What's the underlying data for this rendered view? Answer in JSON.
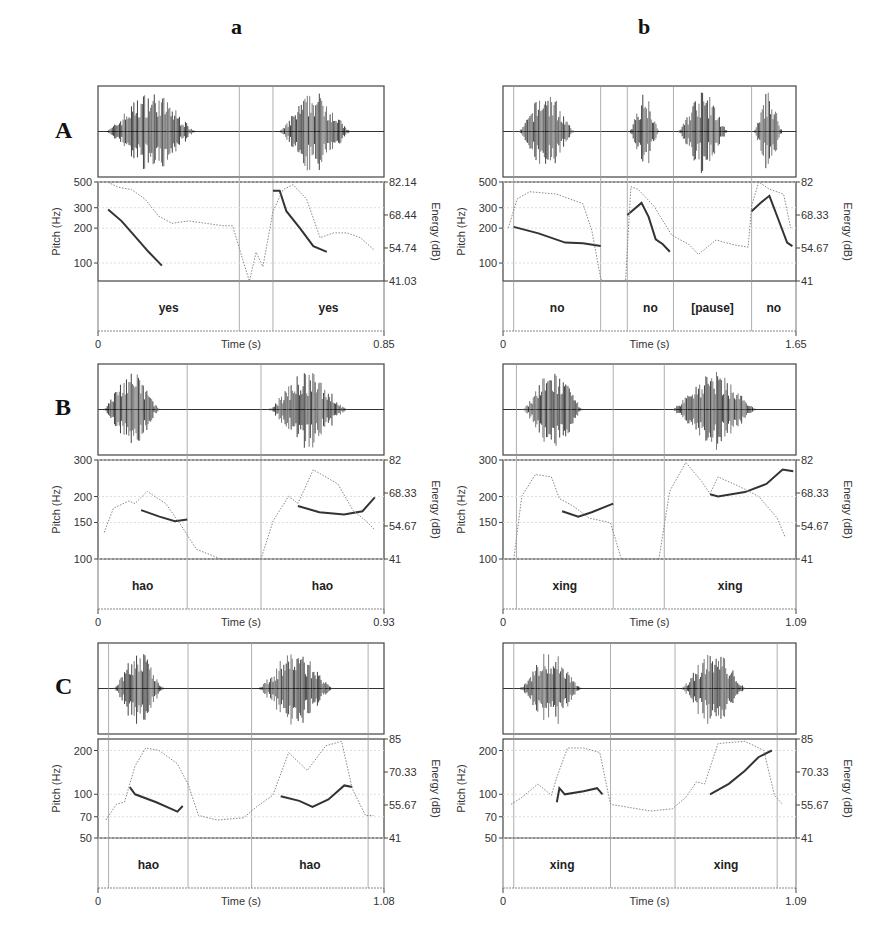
{
  "columns": [
    {
      "label": "a"
    },
    {
      "label": "b"
    }
  ],
  "rows": [
    {
      "label": "A"
    },
    {
      "label": "B"
    },
    {
      "label": "C"
    }
  ],
  "axis_labels": {
    "pitch": "Pitch (Hz)",
    "energy": "Energy (dB)",
    "time": "Time (s)"
  },
  "chart_data": [
    {
      "id": "A-a",
      "type": "line",
      "row": "A",
      "column": "a",
      "title": "",
      "xlabel": "Time (s)",
      "ylabel": "Pitch (Hz)",
      "ylabel_right": "Energy (dB)",
      "xlim": [
        0,
        0.85
      ],
      "x_ticks": [
        "0",
        "0.85"
      ],
      "pitch_ticks": [
        "500",
        "300",
        "200",
        "100"
      ],
      "pitch_ylim": [
        70,
        500
      ],
      "pitch_scale": "log",
      "energy_ticks": [
        "82.14",
        "68.44",
        "54.74",
        "41.03"
      ],
      "energy_ylim": [
        41.03,
        82.14
      ],
      "words": [
        {
          "text": "yes",
          "start": 0.0,
          "end": 0.42
        },
        {
          "text": "yes",
          "start": 0.52,
          "end": 0.85
        }
      ],
      "boundaries": [
        0.42,
        0.52
      ],
      "series": [
        {
          "name": "Pitch (solid)",
          "x": [
            0.03,
            0.07,
            0.11,
            0.15,
            0.19
          ],
          "values": [
            290,
            230,
            170,
            125,
            95
          ]
        },
        {
          "name": "Pitch (solid) 2",
          "x": [
            0.52,
            0.54,
            0.56,
            0.6,
            0.64,
            0.68
          ],
          "values": [
            420,
            420,
            280,
            200,
            140,
            125
          ]
        },
        {
          "name": "Energy (dotted)",
          "x": [
            0.03,
            0.06,
            0.1,
            0.14,
            0.18,
            0.22,
            0.27,
            0.32,
            0.37,
            0.4,
            0.43,
            0.45,
            0.47,
            0.49,
            0.52,
            0.55,
            0.58,
            0.62,
            0.66,
            0.7,
            0.74,
            0.78,
            0.82
          ],
          "values": [
            82,
            80,
            79,
            75,
            68,
            65,
            66,
            65,
            64,
            64,
            50,
            41,
            53,
            47,
            70,
            79,
            81,
            75,
            59,
            61,
            61,
            59,
            54
          ]
        }
      ]
    },
    {
      "id": "A-b",
      "type": "line",
      "row": "A",
      "column": "b",
      "title": "",
      "xlabel": "Time (s)",
      "ylabel": "Pitch (Hz)",
      "ylabel_right": "Energy (dB)",
      "xlim": [
        0,
        1.65
      ],
      "x_ticks": [
        "0",
        "1.65"
      ],
      "pitch_ticks": [
        "500",
        "300",
        "200",
        "100"
      ],
      "pitch_ylim": [
        70,
        500
      ],
      "pitch_scale": "log",
      "energy_ticks": [
        "82",
        "68.33",
        "54.67",
        "41"
      ],
      "energy_ylim": [
        41,
        82
      ],
      "words": [
        {
          "text": "no",
          "start": 0.06,
          "end": 0.55
        },
        {
          "text": "no",
          "start": 0.7,
          "end": 0.96
        },
        {
          "text": "[pause]",
          "start": 0.96,
          "end": 1.4
        },
        {
          "text": "no",
          "start": 1.4,
          "end": 1.65
        }
      ],
      "boundaries": [
        0.06,
        0.55,
        0.7,
        0.96,
        1.4
      ],
      "series": [
        {
          "name": "Pitch (solid)",
          "x": [
            0.06,
            0.2,
            0.35,
            0.45,
            0.55
          ],
          "values": [
            205,
            180,
            150,
            148,
            140
          ]
        },
        {
          "name": "Pitch (solid) 2",
          "x": [
            0.7,
            0.78,
            0.82,
            0.86,
            0.9,
            0.94
          ],
          "values": [
            260,
            330,
            250,
            160,
            145,
            125
          ]
        },
        {
          "name": "Pitch (solid) 3",
          "x": [
            1.4,
            1.45,
            1.5,
            1.55,
            1.6,
            1.63
          ],
          "values": [
            280,
            330,
            380,
            240,
            150,
            140
          ]
        },
        {
          "name": "Energy (dotted)",
          "x": [
            0.03,
            0.08,
            0.15,
            0.3,
            0.45,
            0.5,
            0.55,
            0.56,
            0.69,
            0.72,
            0.76,
            0.85,
            0.95,
            1.05,
            1.1,
            1.2,
            1.3,
            1.38,
            1.4,
            1.44,
            1.5,
            1.58,
            1.62
          ],
          "values": [
            63,
            75,
            78,
            77,
            73,
            62,
            42,
            41,
            41,
            80,
            79,
            72,
            60,
            56,
            52,
            58,
            56,
            55,
            72,
            82,
            79,
            77,
            63
          ]
        }
      ]
    },
    {
      "id": "B-a",
      "type": "line",
      "row": "B",
      "column": "a",
      "title": "",
      "xlabel": "Time (s)",
      "ylabel": "Pitch (Hz)",
      "ylabel_right": "Energy (dB)",
      "xlim": [
        0,
        0.93
      ],
      "x_ticks": [
        "0",
        "0.93"
      ],
      "pitch_ticks": [
        "300",
        "200",
        "150",
        "100"
      ],
      "pitch_ylim": [
        100,
        300
      ],
      "pitch_scale": "log",
      "energy_ticks": [
        "82",
        "68.33",
        "54.67",
        "41"
      ],
      "energy_ylim": [
        41,
        82
      ],
      "words": [
        {
          "text": "hao",
          "start": 0.0,
          "end": 0.29
        },
        {
          "text": "hao",
          "start": 0.53,
          "end": 0.93
        }
      ],
      "boundaries": [
        0.29,
        0.53
      ],
      "series": [
        {
          "name": "Pitch (solid)",
          "x": [
            0.14,
            0.2,
            0.25,
            0.29
          ],
          "values": [
            172,
            160,
            152,
            155
          ]
        },
        {
          "name": "Pitch (solid) 2",
          "x": [
            0.65,
            0.72,
            0.8,
            0.86,
            0.9
          ],
          "values": [
            180,
            168,
            164,
            170,
            198
          ]
        },
        {
          "name": "Energy (dotted)",
          "x": [
            0.02,
            0.05,
            0.1,
            0.12,
            0.16,
            0.22,
            0.27,
            0.32,
            0.4,
            0.53,
            0.57,
            0.62,
            0.65,
            0.7,
            0.78,
            0.83,
            0.87,
            0.9
          ],
          "values": [
            52,
            62,
            65,
            64,
            69,
            64,
            55,
            45,
            41,
            41,
            57,
            67,
            64,
            78,
            72,
            61,
            57,
            53
          ]
        }
      ]
    },
    {
      "id": "B-b",
      "type": "line",
      "row": "B",
      "column": "b",
      "title": "",
      "xlabel": "Time (s)",
      "ylabel": "Pitch (Hz)",
      "ylabel_right": "Energy (dB)",
      "xlim": [
        0,
        1.09
      ],
      "x_ticks": [
        "0",
        "1.09"
      ],
      "pitch_ticks": [
        "300",
        "200",
        "150",
        "100"
      ],
      "pitch_ylim": [
        100,
        300
      ],
      "pitch_scale": "log",
      "energy_ticks": [
        "82",
        "68.33",
        "54.67",
        "41"
      ],
      "energy_ylim": [
        41,
        82
      ],
      "words": [
        {
          "text": "xing",
          "start": 0.05,
          "end": 0.41
        },
        {
          "text": "xing",
          "start": 0.6,
          "end": 1.09
        }
      ],
      "boundaries": [
        0.05,
        0.41,
        0.6
      ],
      "series": [
        {
          "name": "Pitch (solid)",
          "x": [
            0.22,
            0.28,
            0.33,
            0.41
          ],
          "values": [
            170,
            160,
            168,
            185
          ]
        },
        {
          "name": "Pitch (solid) 2",
          "x": [
            0.77,
            0.8,
            0.9,
            0.98,
            1.04,
            1.08
          ],
          "values": [
            205,
            200,
            210,
            230,
            270,
            265
          ]
        },
        {
          "name": "Energy (dotted)",
          "x": [
            0.04,
            0.07,
            0.12,
            0.18,
            0.21,
            0.26,
            0.32,
            0.4,
            0.44,
            0.58,
            0.62,
            0.68,
            0.74,
            0.77,
            0.8,
            0.88,
            0.95,
            1.02,
            1.05
          ],
          "values": [
            41,
            67,
            76,
            75,
            66,
            63,
            58,
            56,
            41,
            41,
            69,
            81,
            73,
            68,
            75,
            71,
            67,
            58,
            50
          ]
        }
      ]
    },
    {
      "id": "C-a",
      "type": "line",
      "row": "C",
      "column": "a",
      "title": "",
      "xlabel": "Time (s)",
      "ylabel": "Pitch (Hz)",
      "ylabel_right": "Energy (dB)",
      "xlim": [
        0,
        1.08
      ],
      "x_ticks": [
        "0",
        "1.08"
      ],
      "pitch_ticks": [
        "200",
        "100",
        "70",
        "50"
      ],
      "pitch_ylim": [
        50,
        240
      ],
      "pitch_scale": "log",
      "energy_ticks": [
        "85",
        "70.33",
        "55.67",
        "41"
      ],
      "energy_ylim": [
        41,
        85
      ],
      "words": [
        {
          "text": "hao",
          "start": 0.04,
          "end": 0.34
        },
        {
          "text": "hao",
          "start": 0.58,
          "end": 1.02
        }
      ],
      "boundaries": [
        0.04,
        0.34,
        0.58,
        1.02
      ],
      "series": [
        {
          "name": "Pitch (solid)",
          "x": [
            0.12,
            0.14,
            0.22,
            0.3,
            0.32
          ],
          "values": [
            112,
            100,
            88,
            76,
            83
          ]
        },
        {
          "name": "Pitch (solid) 2",
          "x": [
            0.69,
            0.76,
            0.81,
            0.87,
            0.93,
            0.96
          ],
          "values": [
            97,
            90,
            82,
            92,
            115,
            112
          ]
        },
        {
          "name": "Energy (dotted)",
          "x": [
            0.03,
            0.07,
            0.1,
            0.14,
            0.18,
            0.23,
            0.3,
            0.34,
            0.38,
            0.45,
            0.55,
            0.6,
            0.66,
            0.72,
            0.79,
            0.86,
            0.92,
            0.96,
            1.01,
            1.04
          ],
          "values": [
            49,
            56,
            57,
            73,
            81,
            80,
            74,
            65,
            51,
            49,
            50,
            55,
            60,
            79,
            71,
            82,
            84,
            63,
            51,
            51
          ]
        }
      ]
    },
    {
      "id": "C-b",
      "type": "line",
      "row": "C",
      "column": "b",
      "title": "",
      "xlabel": "Time (s)",
      "ylabel": "Pitch (Hz)",
      "ylabel_right": "Energy (dB)",
      "xlim": [
        0,
        1.09
      ],
      "x_ticks": [
        "0",
        "1.09"
      ],
      "pitch_ticks": [
        "200",
        "100",
        "70",
        "50"
      ],
      "pitch_ylim": [
        50,
        240
      ],
      "pitch_scale": "log",
      "energy_ticks": [
        "85",
        "70.33",
        "55.67",
        "41"
      ],
      "energy_ylim": [
        41,
        85
      ],
      "words": [
        {
          "text": "xing",
          "start": 0.04,
          "end": 0.4
        },
        {
          "text": "xing",
          "start": 0.64,
          "end": 1.02
        }
      ],
      "boundaries": [
        0.04,
        0.4,
        0.64,
        1.02
      ],
      "series": [
        {
          "name": "Pitch (solid)",
          "x": [
            0.2,
            0.21,
            0.23,
            0.3,
            0.35,
            0.37
          ],
          "values": [
            88,
            110,
            100,
            105,
            110,
            100
          ]
        },
        {
          "name": "Pitch (solid) 2",
          "x": [
            0.77,
            0.84,
            0.9,
            0.95,
            1.0
          ],
          "values": [
            100,
            118,
            145,
            180,
            200
          ]
        },
        {
          "name": "Energy (dotted)",
          "x": [
            0.03,
            0.07,
            0.13,
            0.18,
            0.2,
            0.24,
            0.3,
            0.36,
            0.4,
            0.5,
            0.55,
            0.63,
            0.68,
            0.72,
            0.75,
            0.8,
            0.9,
            0.97,
            1.01,
            1.04
          ],
          "values": [
            56,
            59,
            65,
            60,
            68,
            81,
            81,
            79,
            56,
            54,
            53,
            54,
            59,
            66,
            65,
            83,
            84,
            80,
            60,
            56
          ]
        }
      ]
    }
  ]
}
